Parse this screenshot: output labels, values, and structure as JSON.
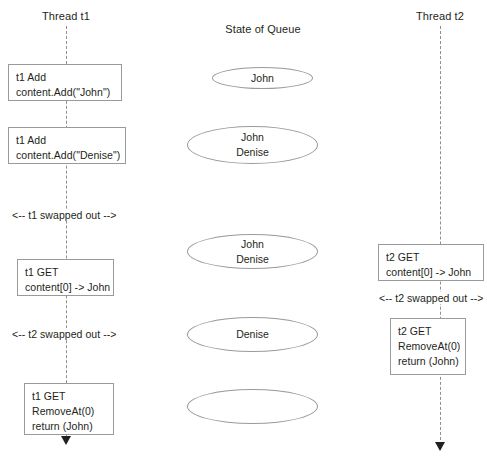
{
  "diagram": {
    "columns": {
      "left": {
        "title": "Thread t1"
      },
      "middle": {
        "title": "State of Queue"
      },
      "right": {
        "title": "Thread t2"
      }
    },
    "thread_t1_events": [
      {
        "name": "t1-add-john",
        "text": "t1 Add\ncontent.Add(\"John\")"
      },
      {
        "name": "t1-add-denise",
        "text": "t1 Add\ncontent.Add(\"Denise\")"
      },
      {
        "name": "t1-swapped-out",
        "text": "<-- t1 swapped out -->"
      },
      {
        "name": "t1-get-content",
        "text": "t1 GET\ncontent[0] -> John"
      },
      {
        "name": "t2-swapped-out",
        "text": "<-- t2 swapped out -->"
      },
      {
        "name": "t1-get-removeat",
        "text": "t1 GET\nRemoveAt(0)\nreturn (John)"
      }
    ],
    "thread_t2_events": [
      {
        "name": "t2-get-content",
        "text": "t2 GET\ncontent[0] -> John"
      },
      {
        "name": "t2-swapped-out",
        "text": "<-- t2 swapped out -->"
      },
      {
        "name": "t2-get-removeat",
        "text": "t2 GET\nRemoveAt(0)\nreturn (John)"
      }
    ],
    "queue_states": [
      {
        "name": "queue-state-1",
        "text": "John"
      },
      {
        "name": "queue-state-2",
        "text": "John\nDenise"
      },
      {
        "name": "queue-state-3",
        "text": "John\nDenise"
      },
      {
        "name": "queue-state-4",
        "text": "Denise"
      },
      {
        "name": "queue-state-5",
        "text": ""
      }
    ],
    "colors": {
      "stroke": "#9a9a9a",
      "lifeline": "#8e8e8e",
      "text": "#231f20",
      "background": "#ffffff"
    }
  }
}
